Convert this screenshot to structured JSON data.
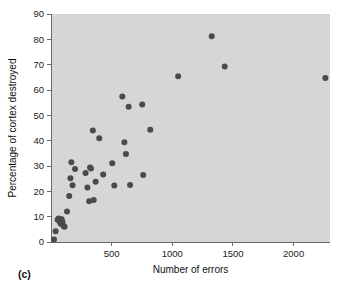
{
  "panel": {
    "label": "(c)"
  },
  "colors": {
    "plot_background": "#d6d6d6",
    "point_fill": "#4a4a4a",
    "axis": "#6a6a6a",
    "text": "#111111",
    "figure_background": "#ffffff"
  },
  "chart_data": {
    "type": "scatter",
    "title": "",
    "xlabel": "Number of errors",
    "ylabel": "Percentage of cortex destroyed",
    "xlim": [
      0,
      2300
    ],
    "ylim": [
      0,
      90
    ],
    "xticks": [
      500,
      1000,
      1500,
      2000
    ],
    "xtick_labels": [
      "500",
      "1000",
      "1500",
      "2000"
    ],
    "yticks": [
      0,
      10,
      20,
      30,
      40,
      50,
      60,
      70,
      80,
      90
    ],
    "ytick_labels": [
      "0",
      "10",
      "20",
      "30",
      "40",
      "50",
      "60",
      "70",
      "80",
      "90"
    ],
    "grid": false,
    "legend": false,
    "marker": "circle",
    "marker_size": 3,
    "points": [
      {
        "x": 25,
        "y": 1.0
      },
      {
        "x": 38,
        "y": 4.2
      },
      {
        "x": 55,
        "y": 8.8
      },
      {
        "x": 62,
        "y": 9.3
      },
      {
        "x": 72,
        "y": 8.0
      },
      {
        "x": 80,
        "y": 7.2
      },
      {
        "x": 88,
        "y": 9.0
      },
      {
        "x": 95,
        "y": 7.8
      },
      {
        "x": 105,
        "y": 6.2
      },
      {
        "x": 112,
        "y": 6.0
      },
      {
        "x": 132,
        "y": 12.0
      },
      {
        "x": 150,
        "y": 18.2
      },
      {
        "x": 160,
        "y": 25.2
      },
      {
        "x": 168,
        "y": 31.5
      },
      {
        "x": 178,
        "y": 22.4
      },
      {
        "x": 198,
        "y": 28.8
      },
      {
        "x": 285,
        "y": 27.2
      },
      {
        "x": 300,
        "y": 21.5
      },
      {
        "x": 315,
        "y": 16.1
      },
      {
        "x": 322,
        "y": 29.4
      },
      {
        "x": 330,
        "y": 29.0
      },
      {
        "x": 345,
        "y": 44.0
      },
      {
        "x": 352,
        "y": 16.6
      },
      {
        "x": 368,
        "y": 23.8
      },
      {
        "x": 398,
        "y": 41.0
      },
      {
        "x": 430,
        "y": 26.6
      },
      {
        "x": 505,
        "y": 31.1
      },
      {
        "x": 522,
        "y": 22.3
      },
      {
        "x": 588,
        "y": 57.4
      },
      {
        "x": 605,
        "y": 39.4
      },
      {
        "x": 618,
        "y": 34.7
      },
      {
        "x": 640,
        "y": 53.4
      },
      {
        "x": 652,
        "y": 22.5
      },
      {
        "x": 752,
        "y": 54.3
      },
      {
        "x": 760,
        "y": 26.4
      },
      {
        "x": 818,
        "y": 44.3
      },
      {
        "x": 1048,
        "y": 65.4
      },
      {
        "x": 1325,
        "y": 81.2
      },
      {
        "x": 1432,
        "y": 69.3
      },
      {
        "x": 2262,
        "y": 64.7
      }
    ]
  }
}
